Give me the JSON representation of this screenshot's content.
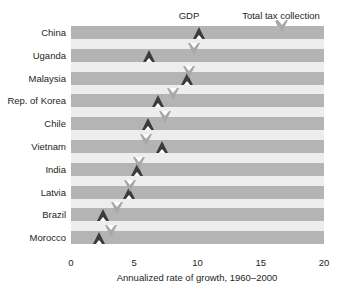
{
  "legend": {
    "gdp_label": "GDP",
    "tax_label": "Total tax collection",
    "gdp_icon": "up-triangle-marker",
    "tax_icon": "down-triangle-marker"
  },
  "axis": {
    "title": "Annualized rate of growth, 1960–2000",
    "ticks": [
      "0",
      "5",
      "10",
      "15",
      "20"
    ]
  },
  "colors": {
    "gdp_marker": "#3b3b3b",
    "tax_marker": "#a8a8a8",
    "band": "#b4b4b4",
    "band_gap": "#ededed",
    "text": "#231f20",
    "background": "#ffffff"
  },
  "chart_data": {
    "type": "scatter",
    "title": "",
    "subtitle": "",
    "xlabel": "Annualized rate of growth, 1960–2000",
    "ylabel": "",
    "xlim": [
      0,
      20
    ],
    "xticks": [
      0,
      5,
      10,
      15,
      20
    ],
    "grid": false,
    "orientation": "horizontal",
    "legend_position": "top",
    "categories": [
      "China",
      "Uganda",
      "Malaysia",
      "Rep. of Korea",
      "Chile",
      "Vietnam",
      "India",
      "Latvia",
      "Brazil",
      "Morocco"
    ],
    "series": [
      {
        "name": "GDP",
        "marker": "up-triangle",
        "color": "#3b3b3b",
        "values": [
          10.1,
          6.2,
          9.2,
          6.9,
          6.1,
          7.2,
          5.2,
          4.6,
          2.5,
          2.2
        ]
      },
      {
        "name": "Total tax collection",
        "marker": "down-triangle",
        "color": "#a8a8a8",
        "values": [
          16.7,
          9.7,
          9.3,
          8.1,
          7.4,
          5.9,
          5.4,
          4.7,
          3.6,
          3.2
        ]
      }
    ]
  }
}
